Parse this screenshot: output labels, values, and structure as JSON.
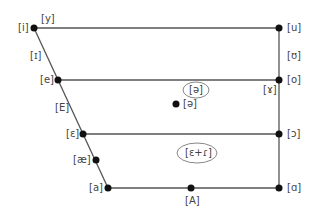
{
  "chart_data": {
    "type": "diagram",
    "colors": {
      "line": "#555555",
      "dot": "#111111",
      "text": "#444444",
      "ellipse": "#888888"
    },
    "lines": [
      {
        "from": "i",
        "to": "u"
      },
      {
        "from": "e",
        "to": "o"
      },
      {
        "from": "ɛ",
        "to": "ɔ"
      },
      {
        "from": "a",
        "to": "ɑ"
      },
      {
        "from": "i",
        "to": "a"
      },
      {
        "from": "u",
        "to": "ɑ"
      }
    ],
    "points": [
      {
        "id": "i",
        "x": 34,
        "y": 28
      },
      {
        "id": "u",
        "x": 279,
        "y": 28
      },
      {
        "id": "e",
        "x": 58,
        "y": 80
      },
      {
        "id": "o",
        "x": 279,
        "y": 80
      },
      {
        "id": "ɛ",
        "x": 83,
        "y": 134
      },
      {
        "id": "ɔ",
        "x": 279,
        "y": 134
      },
      {
        "id": "æ",
        "x": 96,
        "y": 160
      },
      {
        "id": "a",
        "x": 108,
        "y": 188
      },
      {
        "id": "A",
        "x": 191,
        "y": 188
      },
      {
        "id": "ɑ",
        "x": 279,
        "y": 188
      },
      {
        "id": "ə",
        "x": 176,
        "y": 104
      }
    ],
    "labels": [
      {
        "text": "[i]",
        "x": 18,
        "y": 23
      },
      {
        "text": "[y]",
        "x": 41,
        "y": 14
      },
      {
        "text": "[ɪ]",
        "x": 30,
        "y": 51
      },
      {
        "text": "[e]",
        "x": 40,
        "y": 75
      },
      {
        "text": "[E]",
        "x": 55,
        "y": 103
      },
      {
        "text": "[ɛ]",
        "x": 66,
        "y": 129
      },
      {
        "text": "[æ]",
        "x": 73,
        "y": 155
      },
      {
        "text": "[a]",
        "x": 89,
        "y": 183
      },
      {
        "text": "[A]",
        "x": 185,
        "y": 196
      },
      {
        "text": "[u]",
        "x": 287,
        "y": 23
      },
      {
        "text": "[ʊ]",
        "x": 287,
        "y": 51
      },
      {
        "text": "[o]",
        "x": 287,
        "y": 75
      },
      {
        "text": "[ɤ]",
        "x": 263,
        "y": 85
      },
      {
        "text": "[ɔ]",
        "x": 287,
        "y": 129
      },
      {
        "text": "[ɑ]",
        "x": 287,
        "y": 183
      },
      {
        "text": "[ə]",
        "x": 183,
        "y": 99
      },
      {
        "text": "[ə]",
        "x": 189,
        "y": 85
      },
      {
        "text": "[ɛ+ɾ]",
        "x": 185,
        "y": 148
      }
    ],
    "ellipses": [
      {
        "label": "[ə]",
        "cx": 196,
        "cy": 90,
        "rx": 13,
        "ry": 8
      },
      {
        "label": "[ɛ+ɾ]",
        "cx": 197,
        "cy": 153,
        "rx": 20,
        "ry": 10
      }
    ]
  }
}
